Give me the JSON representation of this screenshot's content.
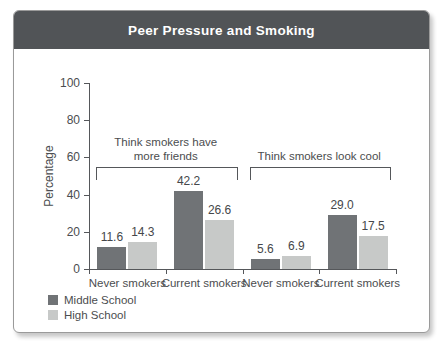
{
  "window": {
    "title": "Peer Pressure and Smoking"
  },
  "colors": {
    "title_bar": "#515457",
    "title_text": "#ffffff",
    "axis": "#55575a",
    "text": "#4b4d4f",
    "middle_school_bar": "#707376",
    "high_school_bar": "#c7c9c8"
  },
  "chart_data": {
    "type": "bar",
    "title": "Peer Pressure and Smoking",
    "xlabel": "",
    "ylabel": "Percentage",
    "ylim": [
      0,
      100
    ],
    "yticks": [
      0,
      20,
      40,
      60,
      80,
      100
    ],
    "grid": false,
    "categories": [
      "Never smokers",
      "Current smokers",
      "Never smokers",
      "Current smokers"
    ],
    "series": [
      {
        "name": "Middle School",
        "color": "#707376",
        "values": [
          11.6,
          42.2,
          5.6,
          29.0
        ]
      },
      {
        "name": "High School",
        "color": "#c7c9c8",
        "values": [
          14.3,
          26.6,
          6.9,
          17.5
        ]
      }
    ],
    "value_labels": [
      [
        "11.6",
        "42.2",
        "5.6",
        "29.0"
      ],
      [
        "14.3",
        "26.6",
        "6.9",
        "17.5"
      ]
    ],
    "annotations": [
      {
        "text_lines": [
          "Think smokers have",
          "more friends"
        ],
        "group_span": [
          0,
          1
        ]
      },
      {
        "text_lines": [
          "Think smokers look cool"
        ],
        "group_span": [
          2,
          3
        ]
      }
    ],
    "legend": [
      {
        "label": "Middle School",
        "color": "#707376"
      },
      {
        "label": "High School",
        "color": "#c7c9c8"
      }
    ],
    "legend_position": "bottom-left"
  }
}
